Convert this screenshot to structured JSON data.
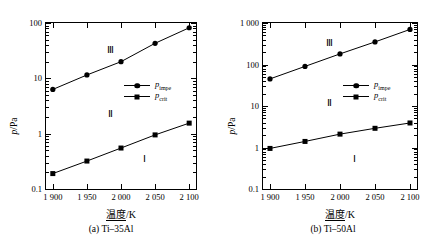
{
  "figure": {
    "panels": [
      {
        "id": "panel-a",
        "caption": "(a) Ti–35Al",
        "ylabel_p": "p",
        "ylabel_unit": "/Pa",
        "xtitle_cn": "温度",
        "xtitle_unit": "/K",
        "regions": [
          {
            "label": "Ⅲ",
            "x": 1985,
            "y": 32
          },
          {
            "label": "Ⅱ",
            "x": 1985,
            "y": 2.3
          },
          {
            "label": "Ⅰ",
            "x": 2035,
            "y": 0.35
          }
        ],
        "legend": [
          {
            "marker": "circle",
            "text": "p",
            "sub": "impe"
          },
          {
            "marker": "square",
            "text": "p",
            "sub": "crit"
          }
        ],
        "chart_data": {
          "type": "line",
          "title": "(a) Ti–35Al",
          "xlabel": "温度/K",
          "ylabel": "p/Pa",
          "yscale": "log",
          "xlim": [
            1890,
            2110
          ],
          "ylim": [
            0.1,
            100
          ],
          "ytick_labels": [
            "0.1",
            "1",
            "10",
            "100"
          ],
          "yticks": [
            0.1,
            1,
            10,
            100
          ],
          "xticks": [
            1900,
            1950,
            2000,
            2050,
            2100
          ],
          "xtick_labels": [
            "1 900",
            "1 950",
            "2 000",
            "2 050",
            "2 100"
          ],
          "grid": false,
          "legend_position": "right-middle",
          "x": [
            1900,
            1950,
            2000,
            2050,
            2100
          ],
          "series": [
            {
              "name": "p_impe",
              "marker": "circle",
              "values": [
                6.3,
                11.5,
                20.0,
                43.0,
                82.0
              ]
            },
            {
              "name": "p_crit",
              "marker": "square",
              "values": [
                0.19,
                0.32,
                0.55,
                0.95,
                1.55
              ]
            }
          ]
        }
      },
      {
        "id": "panel-b",
        "caption": "(b) Ti–50Al",
        "ylabel_p": "p",
        "ylabel_unit": "/Pa",
        "xtitle_cn": "温度",
        "xtitle_unit": "/K",
        "regions": [
          {
            "label": "Ⅲ",
            "x": 1985,
            "y": 330
          },
          {
            "label": "Ⅱ",
            "x": 1985,
            "y": 12
          },
          {
            "label": "Ⅰ",
            "x": 2020,
            "y": 0.52
          }
        ],
        "legend": [
          {
            "marker": "circle",
            "text": "p",
            "sub": "impe"
          },
          {
            "marker": "square",
            "text": "p",
            "sub": "crit"
          }
        ],
        "chart_data": {
          "type": "line",
          "title": "(b) Ti–50Al",
          "xlabel": "温度/K",
          "ylabel": "p/Pa",
          "yscale": "log",
          "xlim": [
            1890,
            2110
          ],
          "ylim": [
            0.1,
            1000
          ],
          "ytick_labels": [
            "0.1",
            "1",
            "10",
            "100",
            "1 000"
          ],
          "yticks": [
            0.1,
            1,
            10,
            100,
            1000
          ],
          "xticks": [
            1900,
            1950,
            2000,
            2050,
            2100
          ],
          "xtick_labels": [
            "1 900",
            "1 950",
            "2 000",
            "2 050",
            "2 100"
          ],
          "grid": false,
          "legend_position": "right-middle",
          "x": [
            1900,
            1950,
            2000,
            2050,
            2100
          ],
          "series": [
            {
              "name": "p_impe",
              "marker": "circle",
              "values": [
                45.0,
                90.0,
                180.0,
                350.0,
                700.0
              ]
            },
            {
              "name": "p_crit",
              "marker": "square",
              "values": [
                0.95,
                1.4,
                2.1,
                2.9,
                3.9
              ]
            }
          ]
        }
      }
    ]
  }
}
